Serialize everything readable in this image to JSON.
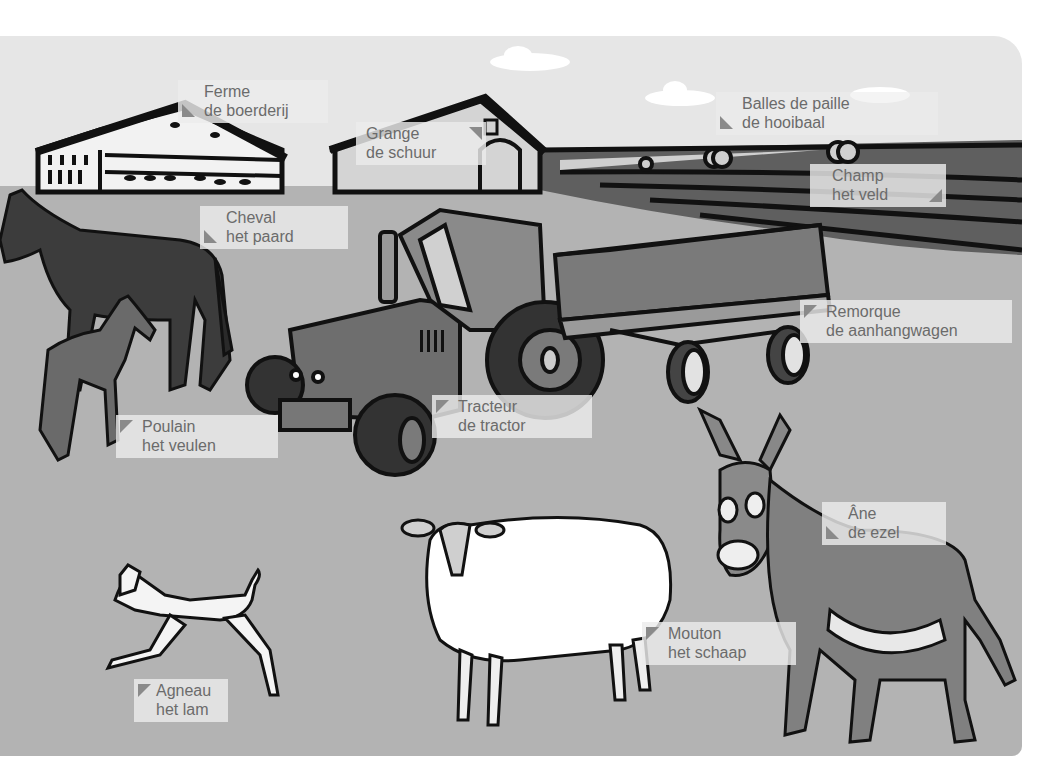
{
  "illustration": {
    "subject": "farm scene with labeled items",
    "colors": {
      "sky": "#e6e6e6",
      "ground": "#b3b3b3",
      "label_bg": "#ececec",
      "label_text": "#6b6b6b",
      "label_marker": "#8a8a8a"
    }
  },
  "labels": [
    {
      "id": "farm",
      "fr": "Ferme",
      "nl": "de boerderij"
    },
    {
      "id": "barn",
      "fr": "Grange",
      "nl": "de schuur"
    },
    {
      "id": "hay-bales",
      "fr": "Balles de paille",
      "nl": "de hooibaal"
    },
    {
      "id": "field",
      "fr": "Champ",
      "nl": "het veld"
    },
    {
      "id": "horse",
      "fr": "Cheval",
      "nl": "het paard"
    },
    {
      "id": "trailer",
      "fr": "Remorque",
      "nl": "de aanhangwagen"
    },
    {
      "id": "foal",
      "fr": "Poulain",
      "nl": "het veulen"
    },
    {
      "id": "tractor",
      "fr": "Tracteur",
      "nl": "de tractor"
    },
    {
      "id": "donkey",
      "fr": "Âne",
      "nl": "de ezel"
    },
    {
      "id": "sheep",
      "fr": "Mouton",
      "nl": "het schaap"
    },
    {
      "id": "lamb",
      "fr": "Agneau",
      "nl": "het lam"
    }
  ]
}
